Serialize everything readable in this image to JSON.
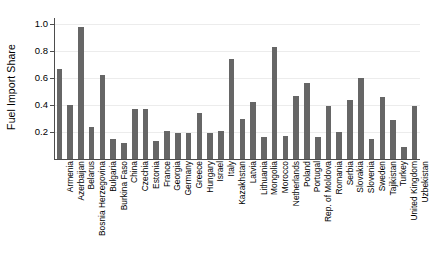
{
  "chart_data": {
    "type": "bar",
    "title": "",
    "subtitle": "",
    "xlabel": "",
    "ylabel": "Fuel Import Share",
    "ylim": [
      0.0,
      1.05
    ],
    "yticks": [
      0.2,
      0.4,
      0.6,
      0.8,
      1.0
    ],
    "ytick_labels": [
      "0.2",
      "0.4",
      "0.6",
      "0.8",
      "1.0"
    ],
    "grid": true,
    "legend": null,
    "bar_color": "#666666",
    "categories": [
      "Armenia",
      "Azerbaijan",
      "Belarus",
      "Bosnia Herzegovina",
      "Bulgaria",
      "Burkina Faso",
      "China",
      "Czechia",
      "Estonia",
      "France",
      "Georgia",
      "Germany",
      "Greece",
      "Hungary",
      "Israel",
      "Italy",
      "Kazakhstan",
      "Latvia",
      "Lithuania",
      "Mongolia",
      "Morocco",
      "Netherlands",
      "Poland",
      "Portugal",
      "Rep. of Moldova",
      "Romania",
      "Serbia",
      "Slovakia",
      "Slovenia",
      "Sweden",
      "Tajikistan",
      "Turkey",
      "United Kingdom",
      "Uzbekistan"
    ],
    "values": [
      0.67,
      0.4,
      0.98,
      0.24,
      0.62,
      0.15,
      0.12,
      0.37,
      0.37,
      0.13,
      0.21,
      0.19,
      0.19,
      0.34,
      0.19,
      0.21,
      0.74,
      0.3,
      0.42,
      0.16,
      0.83,
      0.17,
      0.47,
      0.56,
      0.16,
      0.39,
      0.2,
      0.44,
      0.6,
      0.15,
      0.46,
      0.29,
      0.09,
      0.39
    ]
  }
}
